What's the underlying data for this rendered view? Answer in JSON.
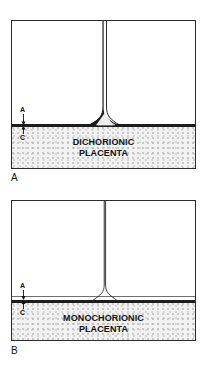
{
  "figure": {
    "kind": "medical-illustration",
    "background_color": "#ffffff",
    "ink_color": "#1c1c1c",
    "placenta_fill_color": "#f2f2f2",
    "placenta_stipple_color": "#9a9a9a"
  },
  "panels": [
    {
      "id": "panel-a",
      "letter": "A",
      "caption_lines": [
        "DICHORIONIC",
        "PLACENTA"
      ],
      "caption_text": "DICHORIONIC PLACENTA",
      "membrane_type": "thick four-layer dividing membrane with twin-peak (lambda) base",
      "membrane_thickness_px": 3.2,
      "callouts": [
        {
          "label": "A",
          "meaning": "amnion",
          "position": "above-chorionic-plate"
        },
        {
          "label": "C",
          "meaning": "chorion",
          "position": "below-chorionic-plate"
        }
      ]
    },
    {
      "id": "panel-b",
      "letter": "B",
      "caption_lines": [
        "MONOCHORIONIC",
        "PLACENTA"
      ],
      "caption_text": "MONOCHORIONIC PLACENTA",
      "membrane_type": "thin two-layer dividing membrane with T-shaped base",
      "membrane_thickness_px": 1.1,
      "callouts": [
        {
          "label": "A",
          "meaning": "amnion",
          "position": "above-chorionic-plate"
        },
        {
          "label": "C",
          "meaning": "chorion",
          "position": "below-chorionic-plate"
        }
      ]
    }
  ]
}
